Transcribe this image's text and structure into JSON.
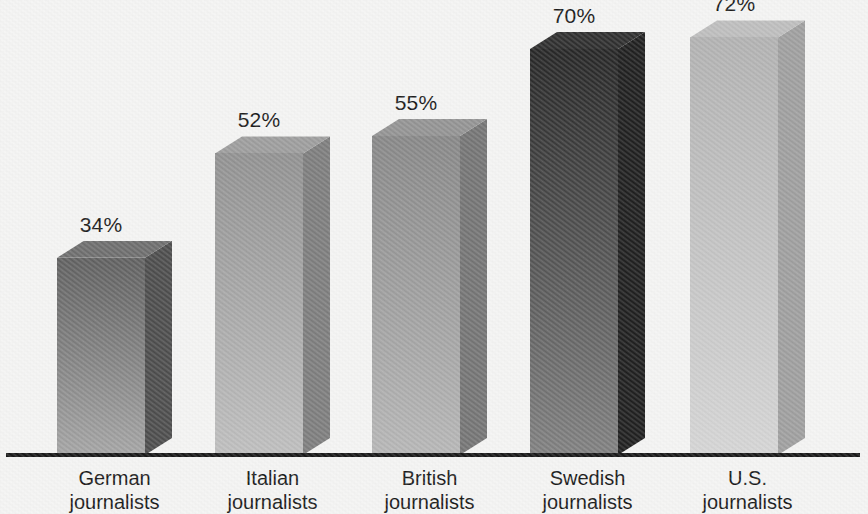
{
  "chart_data": {
    "type": "bar",
    "title": "",
    "subtitle": "",
    "xlabel": "",
    "ylabel": "",
    "grid": false,
    "legend": null,
    "ylim": [
      0,
      100
    ],
    "value_suffix": "%",
    "categories": [
      "German journalists",
      "Italian journalists",
      "British journalists",
      "Swedish journalists",
      "U.S. journalists"
    ],
    "values": [
      34,
      52,
      55,
      70,
      72
    ],
    "data_labels": [
      "34%",
      "52%",
      "55%",
      "70%",
      "72%"
    ],
    "bars": [
      {
        "category_line1": "German",
        "category_line2": "journalists",
        "value": 34,
        "label": "34%",
        "front_top_color": "#5d5d5d",
        "front_bottom_color": "#a3a3a3",
        "side_color": "#4a4a4a",
        "top_color": "#6b6b6b"
      },
      {
        "category_line1": "Italian",
        "category_line2": "journalists",
        "value": 52,
        "label": "52%",
        "front_top_color": "#8f8f8f",
        "front_bottom_color": "#bdbdbd",
        "side_color": "#7b7b7b",
        "top_color": "#9b9b9b"
      },
      {
        "category_line1": "British",
        "category_line2": "journalists",
        "value": 55,
        "label": "55%",
        "front_top_color": "#858585",
        "front_bottom_color": "#b5b5b5",
        "side_color": "#727272",
        "top_color": "#919191"
      },
      {
        "category_line1": "Swedish",
        "category_line2": "journalists",
        "value": 70,
        "label": "70%",
        "front_top_color": "#232323",
        "front_bottom_color": "#7e7e7e",
        "side_color": "#1c1c1c",
        "top_color": "#2b2b2b"
      },
      {
        "category_line1": "U.S.",
        "category_line2": "journalists",
        "value": 72,
        "label": "72%",
        "front_top_color": "#b0b0b0",
        "front_bottom_color": "#d4d4d4",
        "side_color": "#9d9d9d",
        "top_color": "#bcbcbc"
      }
    ],
    "axis_color": "#141414",
    "background_color": "#f4f4f3",
    "text_color": "#151515"
  },
  "geometry": {
    "baseline_y": 455,
    "px_per_percent": 5.8,
    "bar_front_width": 88,
    "bar_depth_x": 27,
    "bar_depth_y": 17,
    "bar_left_positions": [
      57,
      215,
      372,
      530,
      690
    ]
  }
}
